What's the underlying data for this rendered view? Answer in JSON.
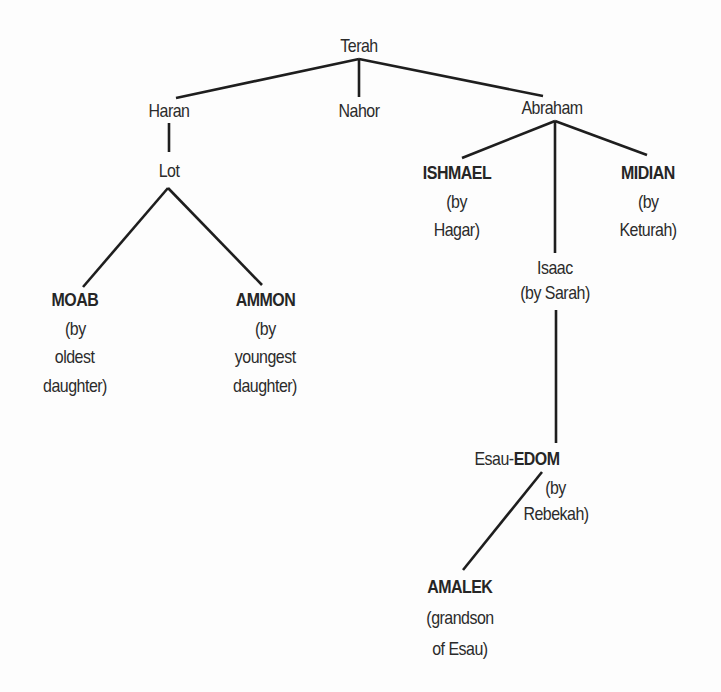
{
  "diagram": {
    "title": "",
    "type": "family-tree",
    "colors": {
      "background": "#fdfdfd",
      "text": "#2b2b2b",
      "lines": "#1e1e1e"
    },
    "nodes": {
      "terah": {
        "name": "Terah"
      },
      "haran": {
        "name": "Haran"
      },
      "nahor": {
        "name": "Nahor"
      },
      "abraham": {
        "name": "Abraham"
      },
      "lot": {
        "name": "Lot"
      },
      "moab": {
        "name": "MOAB",
        "note_lines": [
          "(by",
          "oldest",
          "daughter)"
        ]
      },
      "ammon": {
        "name": "AMMON",
        "note_lines": [
          "(by",
          "youngest",
          "daughter)"
        ]
      },
      "ishmael": {
        "name": "ISHMAEL",
        "note_lines": [
          "(by",
          "Hagar)"
        ]
      },
      "midian": {
        "name": "MIDIAN",
        "note_lines": [
          "(by",
          "Keturah)"
        ]
      },
      "isaac": {
        "name": "Isaac",
        "note_lines": [
          "(by Sarah)"
        ]
      },
      "esau_edom": {
        "prefix": "Esau-",
        "name": "EDOM",
        "note_lines": [
          "(by",
          "Rebekah)"
        ]
      },
      "amalek": {
        "name": "AMALEK",
        "note_lines": [
          "(grandson",
          "of Esau)"
        ]
      }
    },
    "edges": [
      {
        "from": "Terah",
        "to": "Haran"
      },
      {
        "from": "Terah",
        "to": "Nahor"
      },
      {
        "from": "Terah",
        "to": "Abraham"
      },
      {
        "from": "Haran",
        "to": "Lot"
      },
      {
        "from": "Lot",
        "to": "MOAB"
      },
      {
        "from": "Lot",
        "to": "AMMON"
      },
      {
        "from": "Abraham",
        "to": "ISHMAEL"
      },
      {
        "from": "Abraham",
        "to": "Isaac"
      },
      {
        "from": "Abraham",
        "to": "MIDIAN"
      },
      {
        "from": "Isaac",
        "to": "Esau-EDOM"
      },
      {
        "from": "Esau-EDOM",
        "to": "AMALEK"
      }
    ]
  }
}
